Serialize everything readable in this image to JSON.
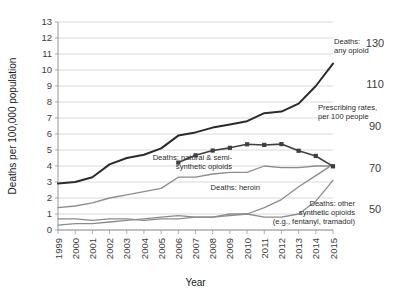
{
  "chart_data": {
    "type": "line",
    "title": "",
    "xlabel": "Year",
    "ylabel": "Deaths per 100,000 population",
    "x": [
      1999,
      2000,
      2001,
      2002,
      2003,
      2004,
      2005,
      2006,
      2007,
      2008,
      2009,
      2010,
      2011,
      2012,
      2013,
      2014,
      2015
    ],
    "xlim": [
      1999,
      2015
    ],
    "ylim": [
      0,
      13
    ],
    "y_ticks": [
      "0",
      "1",
      "2",
      "3",
      "4",
      "5",
      "6",
      "7",
      "8",
      "9",
      "10",
      "11",
      "12",
      "13"
    ],
    "y2_ticks": [
      "50",
      "70",
      "90",
      "110",
      "130"
    ],
    "y2_label": "Prescribing rate per 100 people",
    "y2lim": [
      40,
      140
    ],
    "grid": true,
    "legend_position": "inline-annotations",
    "x_tick_labels": [
      "1999",
      "2000",
      "2001",
      "2002",
      "2003",
      "2004",
      "2005",
      "2006",
      "2007",
      "2008",
      "2009",
      "2010",
      "2011",
      "2012",
      "2013",
      "2014",
      "2015"
    ],
    "series": [
      {
        "name": "Deaths: any opioid",
        "axis": "left",
        "color": "#2b2b2b",
        "width": 2.0,
        "marker": "none",
        "values": [
          2.9,
          3.0,
          3.3,
          4.1,
          4.5,
          4.7,
          5.1,
          5.9,
          6.1,
          6.4,
          6.6,
          6.8,
          7.3,
          7.4,
          7.9,
          9.0,
          10.4
        ]
      },
      {
        "name": "Deaths: natural & semi-synthetic opioids",
        "axis": "left",
        "color": "#8c8c8c",
        "width": 1.3,
        "marker": "none",
        "values": [
          1.4,
          1.5,
          1.7,
          2.0,
          2.2,
          2.4,
          2.6,
          3.3,
          3.3,
          3.5,
          3.6,
          3.6,
          4.0,
          3.9,
          3.9,
          4.0,
          4.0
        ]
      },
      {
        "name": "Deaths: heroin",
        "axis": "left",
        "color": "#8c8c8c",
        "width": 1.3,
        "marker": "none",
        "values": [
          0.7,
          0.7,
          0.6,
          0.7,
          0.7,
          0.6,
          0.7,
          0.7,
          0.8,
          0.8,
          1.0,
          1.0,
          1.4,
          1.9,
          2.7,
          3.4,
          4.1
        ]
      },
      {
        "name": "Deaths: other synthetic opioids (e.g., fentanyl, tramadol)",
        "axis": "left",
        "color": "#8c8c8c",
        "width": 1.3,
        "marker": "none",
        "values": [
          0.3,
          0.4,
          0.4,
          0.5,
          0.6,
          0.7,
          0.8,
          0.9,
          0.8,
          0.8,
          0.9,
          1.0,
          0.8,
          0.8,
          1.0,
          1.8,
          3.1
        ]
      },
      {
        "name": "Prescribing rates, per 100 people",
        "axis": "right",
        "color": "#3f3f3f",
        "width": 1.6,
        "marker": "square",
        "start_year": 2006,
        "values": [
          null,
          null,
          null,
          null,
          null,
          null,
          null,
          72.4,
          75.9,
          78.2,
          79.5,
          81.2,
          80.9,
          81.3,
          78.1,
          75.6,
          70.6
        ]
      }
    ],
    "annotations": [
      {
        "id": "annot-any-opioid",
        "lines": [
          "Deaths:",
          "any opioid"
        ],
        "x": 334,
        "y": 44,
        "align": "start"
      },
      {
        "id": "annot-prescribing",
        "lines": [
          "Prescribing rates,",
          "per 100 people"
        ],
        "x": 318,
        "y": 110,
        "align": "start"
      },
      {
        "id": "annot-natural-semi",
        "lines": [
          "Deaths: natural & semi-",
          "synthetic opioids"
        ],
        "x": 232,
        "y": 160,
        "align": "end"
      },
      {
        "id": "annot-heroin",
        "lines": [
          "Deaths: heroin"
        ],
        "x": 260,
        "y": 190,
        "align": "end"
      },
      {
        "id": "annot-other-synthetic",
        "lines": [
          "Deaths: other",
          "synthetic opioids",
          "(e.g., fentanyl, tramadol)"
        ],
        "x": 355,
        "y": 206,
        "align": "end"
      }
    ]
  }
}
